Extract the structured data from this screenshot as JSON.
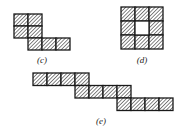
{
  "figures": [
    {
      "id": "c",
      "label": "(c)",
      "label_pos": [
        42,
        55
      ],
      "cell_w": 14,
      "cell_h": 12,
      "cells": [
        [
          14,
          14
        ],
        [
          28,
          14
        ],
        [
          14,
          26
        ],
        [
          28,
          26
        ],
        [
          28,
          38
        ],
        [
          42,
          38
        ],
        [
          56,
          38
        ]
      ],
      "empty": []
    },
    {
      "id": "d",
      "label": "(d)",
      "label_pos": [
        142,
        55
      ],
      "cell_w": 14,
      "cell_h": 14,
      "cells": [
        [
          121,
          7
        ],
        [
          135,
          7
        ],
        [
          149,
          7
        ],
        [
          121,
          21
        ],
        [
          149,
          21
        ],
        [
          121,
          35
        ],
        [
          135,
          35
        ],
        [
          149,
          35
        ]
      ],
      "empty": [
        [
          135,
          21
        ]
      ]
    },
    {
      "id": "e",
      "label": "(e)",
      "label_pos": [
        101,
        116
      ],
      "cell_w": 14,
      "cell_h": 12.5,
      "cells": [
        [
          33,
          73
        ],
        [
          47,
          73
        ],
        [
          61,
          73
        ],
        [
          75,
          73
        ],
        [
          75,
          85.5
        ],
        [
          89,
          85.5
        ],
        [
          103,
          85.5
        ],
        [
          117,
          85.5
        ],
        [
          117,
          98
        ],
        [
          131,
          98
        ],
        [
          145,
          98
        ],
        [
          159,
          98
        ]
      ],
      "empty": []
    }
  ],
  "colors": {
    "stroke": "#1a1a1a",
    "hatch": "#333333",
    "background": "#ffffff"
  }
}
